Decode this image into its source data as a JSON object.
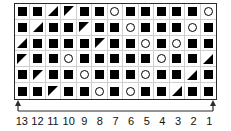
{
  "figure": {
    "name": "symbol-grid-with-numbered-axis",
    "colors": {
      "symbol_fill": "#000000",
      "grid_line": "#cfcfcf",
      "border": "#2b2b2b",
      "axis": "#2b2b2b",
      "background": "#ffffff"
    }
  },
  "chart_data": {
    "type": "heatmap",
    "title": "",
    "xlabel": "",
    "ylabel": "",
    "grid": true,
    "legend_position": "none",
    "columns": 13,
    "rows": 6,
    "x_axis": {
      "direction": "right-to-left",
      "arrow_left": true,
      "arrow_right": true,
      "tick_labels": [
        "13",
        "12",
        "11",
        "10",
        "9",
        "8",
        "7",
        "6",
        "5",
        "4",
        "3",
        "2",
        "1"
      ]
    },
    "symbol_legend": {
      "square": "filled-square",
      "circle": "open-circle",
      "triangle_br": "filled-triangle-lower-right",
      "triangle_ul": "filled-triangle-upper-left"
    },
    "categories": [
      "13",
      "12",
      "11",
      "10",
      "9",
      "8",
      "7",
      "6",
      "5",
      "4",
      "3",
      "2",
      "1"
    ],
    "cells": [
      [
        "square",
        "square",
        "triangle_br",
        "triangle_ul",
        "square",
        "square",
        "circle",
        "square",
        "square",
        "square",
        "square",
        "square",
        "circle"
      ],
      [
        "square",
        "triangle_br",
        "square",
        "square",
        "triangle_ul",
        "square",
        "square",
        "circle",
        "square",
        "square",
        "square",
        "circle",
        "square"
      ],
      [
        "triangle_br",
        "square",
        "square",
        "square",
        "square",
        "triangle_ul",
        "square",
        "square",
        "circle",
        "square",
        "circle",
        "square",
        "square"
      ],
      [
        "triangle_ul",
        "square",
        "square",
        "circle",
        "square",
        "square",
        "square",
        "square",
        "square",
        "circle",
        "square",
        "square",
        "triangle_br"
      ],
      [
        "square",
        "triangle_ul",
        "square",
        "square",
        "circle",
        "square",
        "square",
        "square",
        "circle",
        "square",
        "square",
        "triangle_br",
        "square"
      ],
      [
        "square",
        "square",
        "triangle_ul",
        "square",
        "square",
        "circle",
        "square",
        "circle",
        "square",
        "square",
        "triangle_br",
        "square",
        "square"
      ]
    ]
  }
}
